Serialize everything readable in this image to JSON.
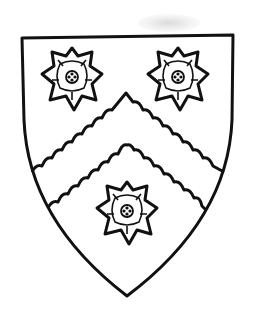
{
  "image": {
    "subject": "heraldic shield (coat of arms)",
    "description": "Shield argent with a chevron engrailed between three Tudor-style roses, line drawing in black on white",
    "colors": {
      "ink": "#111111",
      "field": "#ffffff",
      "smudge": "#c8c8c8"
    },
    "elements": {
      "shield": "shield-outline",
      "chevron": "chevron-engrailed",
      "charges": [
        {
          "name": "rose",
          "position": "dexter-chief"
        },
        {
          "name": "rose",
          "position": "sinister-chief"
        },
        {
          "name": "rose",
          "position": "base"
        }
      ]
    }
  }
}
